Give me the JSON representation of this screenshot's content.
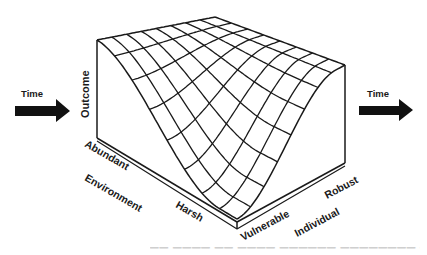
{
  "figure": {
    "type": "3d-wireframe-surface",
    "left_arrow": {
      "label": "Time",
      "icon": "arrow-right-icon"
    },
    "right_arrow": {
      "label": "Time",
      "icon": "arrow-right-icon"
    },
    "axes": {
      "vertical": {
        "title": "Outcome"
      },
      "environment": {
        "title": "Environment",
        "low_end": "Abundant",
        "high_end": "Harsh"
      },
      "individual": {
        "title": "Individual",
        "low_end": "Vulnerable",
        "high_end": "Robust"
      }
    },
    "surface_grid": {
      "environment_lines": 9,
      "individual_lines": 9
    },
    "colors": {
      "ink": "#1a1a1a",
      "background": "#ffffff"
    },
    "caption_visible": "(caption cut off at bottom edge)"
  }
}
